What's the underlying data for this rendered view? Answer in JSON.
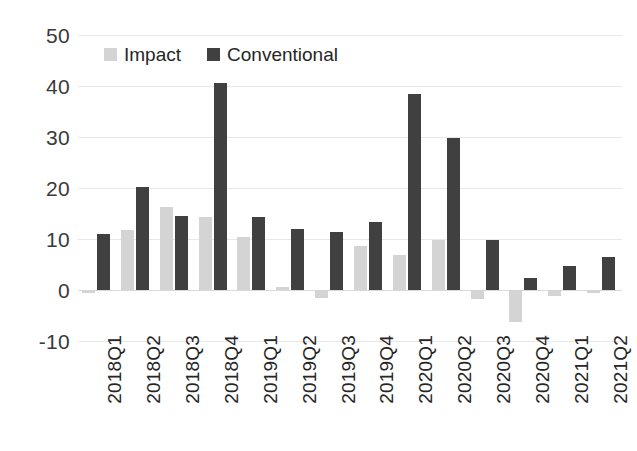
{
  "chart_data": {
    "type": "bar",
    "title": "",
    "subtitle": "",
    "xlabel": "",
    "ylabel": "",
    "ylim": [
      -10,
      50
    ],
    "y_ticks": [
      50,
      40,
      30,
      20,
      10,
      0,
      -10
    ],
    "y_tick_labels": [
      "50",
      "40",
      "30",
      "20",
      "10",
      "0",
      "-10"
    ],
    "grid": true,
    "legend_position": "top-left-inside",
    "orientation": "vertical",
    "categories": [
      "2018Q1",
      "2018Q2",
      "2018Q3",
      "2018Q4",
      "2019Q1",
      "2019Q2",
      "2019Q3",
      "2019Q4",
      "2020Q1",
      "2020Q2",
      "2020Q3",
      "2020Q4",
      "2021Q1",
      "2021Q2"
    ],
    "series": [
      {
        "name": "Impact",
        "color": "#d4d4d4",
        "values": [
          -0.5,
          11.8,
          16.3,
          14.4,
          10.4,
          0.5,
          -1.6,
          8.6,
          6.9,
          9.9,
          -1.8,
          -6.2,
          -1.2,
          -0.6
        ]
      },
      {
        "name": "Conventional",
        "color": "#404040",
        "values": [
          10.9,
          20.2,
          14.6,
          40.6,
          14.3,
          11.9,
          11.4,
          13.4,
          38.5,
          29.8,
          9.8,
          2.3,
          4.8,
          6.5
        ]
      }
    ]
  },
  "legend": {
    "entries": [
      {
        "label": "Impact"
      },
      {
        "label": "Conventional"
      }
    ]
  },
  "colors": {
    "impact": "#d4d4d4",
    "conventional": "#404040",
    "gridline": "#e8e8e8",
    "zeroline": "#d9d9d9",
    "text": "#262626",
    "background": "#ffffff"
  }
}
